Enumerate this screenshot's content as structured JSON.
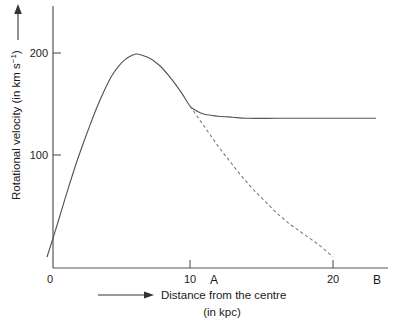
{
  "chart_data": {
    "type": "line",
    "title": "",
    "xlabel": "Distance from the centre (in kpc)",
    "xlabel_line1": "Distance from the centre",
    "xlabel_line2": "(in kpc)",
    "ylabel": "Rotational velocity (in km s⁻¹)",
    "ylabel_main": "Rotational velocity (in km s",
    "ylabel_sup": "−1",
    "ylabel_tail": ")",
    "xlim": [
      0,
      23.5
    ],
    "ylim": [
      0,
      215
    ],
    "xticks": [
      0,
      10,
      20
    ],
    "xtick_labels": [
      "0",
      "10",
      "20"
    ],
    "yticks": [
      100,
      200
    ],
    "ytick_labels": [
      "100",
      "200"
    ],
    "grid": false,
    "legend": "none",
    "annotations": [
      {
        "text": "A",
        "x": 11.5,
        "y": -14,
        "name": "region-label-a"
      },
      {
        "text": "B",
        "x": 22.9,
        "y": -14,
        "name": "region-label-b"
      }
    ],
    "series": [
      {
        "name": "observed rotation curve",
        "style": "solid",
        "color": "#555555",
        "points": [
          [
            0.0,
            0
          ],
          [
            0.5,
            22
          ],
          [
            1.0,
            45
          ],
          [
            1.5,
            68
          ],
          [
            2.0,
            90
          ],
          [
            2.5,
            110
          ],
          [
            3.0,
            129
          ],
          [
            3.5,
            147
          ],
          [
            4.0,
            163
          ],
          [
            4.5,
            177
          ],
          [
            5.0,
            187
          ],
          [
            5.5,
            194
          ],
          [
            6.0,
            198
          ],
          [
            6.3,
            199
          ],
          [
            6.6,
            198
          ],
          [
            7.0,
            196
          ],
          [
            7.5,
            192
          ],
          [
            8.0,
            186
          ],
          [
            8.5,
            178
          ],
          [
            9.0,
            169
          ],
          [
            9.5,
            159
          ],
          [
            10.0,
            148
          ],
          [
            10.5,
            143
          ],
          [
            11.0,
            140
          ],
          [
            11.5,
            139
          ],
          [
            12.0,
            138
          ],
          [
            13.0,
            137
          ],
          [
            14.0,
            136
          ],
          [
            16.0,
            136
          ],
          [
            18.0,
            136
          ],
          [
            20.0,
            136
          ],
          [
            23.0,
            136
          ]
        ]
      },
      {
        "name": "keplerian predicted curve",
        "style": "dashed",
        "color": "#777777",
        "points": [
          [
            10.0,
            148
          ],
          [
            10.5,
            138
          ],
          [
            11.0,
            128
          ],
          [
            11.5,
            118
          ],
          [
            12.0,
            108
          ],
          [
            12.5,
            99
          ],
          [
            13.0,
            90
          ],
          [
            13.5,
            81
          ],
          [
            14.0,
            73
          ],
          [
            14.5,
            65
          ],
          [
            15.0,
            58
          ],
          [
            15.5,
            51
          ],
          [
            16.0,
            44
          ],
          [
            16.5,
            38
          ],
          [
            17.0,
            32
          ],
          [
            17.5,
            27
          ],
          [
            18.0,
            22
          ],
          [
            18.5,
            17
          ],
          [
            19.0,
            12
          ],
          [
            19.5,
            6
          ],
          [
            20.0,
            0
          ]
        ]
      }
    ]
  },
  "axes": {
    "y_arrow_name": "y-axis-direction-arrow",
    "x_arrow_name": "x-axis-direction-arrow"
  }
}
